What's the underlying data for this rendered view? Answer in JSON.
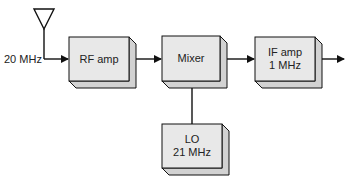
{
  "diagram": {
    "type": "block-diagram",
    "input": {
      "label": "20 MHz",
      "icon": "antenna-icon"
    },
    "blocks": [
      {
        "id": "rf_amp",
        "line1": "RF amp",
        "line2": ""
      },
      {
        "id": "mixer",
        "line1": "Mixer",
        "line2": ""
      },
      {
        "id": "if_amp",
        "line1": "IF amp",
        "line2": "1 MHz"
      },
      {
        "id": "lo",
        "line1": "LO",
        "line2": "21 MHz"
      }
    ],
    "connections": [
      {
        "from": "antenna",
        "to": "rf_amp"
      },
      {
        "from": "rf_amp",
        "to": "mixer"
      },
      {
        "from": "mixer",
        "to": "if_amp"
      },
      {
        "from": "lo",
        "to": "mixer"
      },
      {
        "from": "if_amp",
        "to": "output"
      }
    ],
    "colors": {
      "box_face": "#e8e8e8",
      "box_side": "#d2d2d2",
      "line": "#111111"
    }
  }
}
